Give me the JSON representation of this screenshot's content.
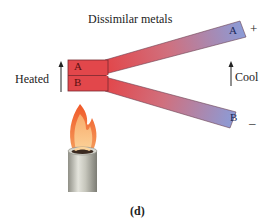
{
  "diagram": {
    "title": "Dissimilar metals",
    "junction": {
      "upper_label": "A",
      "lower_label": "B"
    },
    "hot_side": {
      "label": "Heated"
    },
    "cold_side": {
      "label": "Cool"
    },
    "strips": [
      {
        "end_label": "A",
        "terminal": "+"
      },
      {
        "end_label": "B",
        "terminal": "–"
      }
    ],
    "caption": "(d)",
    "colors": {
      "hot": "#e2474b",
      "cool": "#8c9bd6",
      "outline": "#5a3a4a",
      "text": "#222222",
      "flame_outer": "#f07a3a",
      "flame_inner": "#fbc98a",
      "burner": "#c8c8bc"
    }
  }
}
